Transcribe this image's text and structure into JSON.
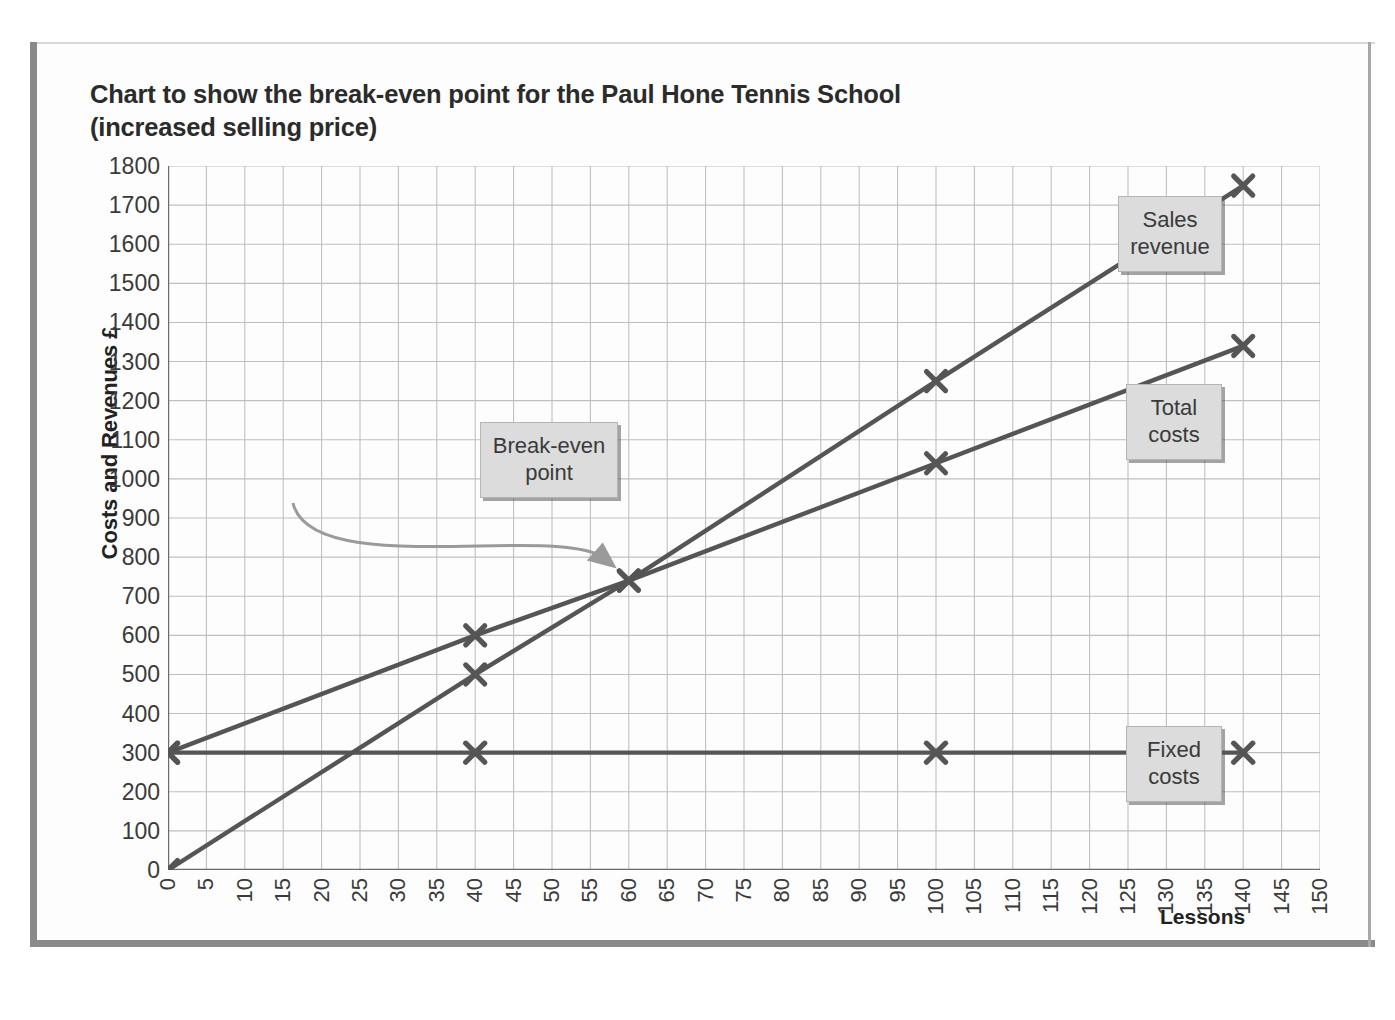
{
  "chart_data": {
    "type": "line",
    "title": "Chart to show the break-even point for the Paul Hone Tennis School (increased selling price)",
    "title_line1": "Chart to show the break-even point for the Paul Hone Tennis School",
    "title_line2": "(increased selling price)",
    "xlabel": "Lessons",
    "ylabel": "Costs and Revenues £",
    "xlim": [
      0,
      150
    ],
    "ylim": [
      0,
      1800
    ],
    "x_tick_step": 5,
    "y_tick_step": 100,
    "grid": true,
    "legend_position": "inline-callouts",
    "x_ticks": [
      0,
      5,
      10,
      15,
      20,
      25,
      30,
      35,
      40,
      45,
      50,
      55,
      60,
      65,
      70,
      75,
      80,
      85,
      90,
      95,
      100,
      105,
      110,
      115,
      120,
      125,
      130,
      135,
      140,
      145,
      150
    ],
    "y_ticks": [
      0,
      100,
      200,
      300,
      400,
      500,
      600,
      700,
      800,
      900,
      1000,
      1100,
      1200,
      1300,
      1400,
      1500,
      1600,
      1700,
      1800
    ],
    "series": [
      {
        "name": "Sales revenue",
        "color": "#555555",
        "marker": "x-bold",
        "x": [
          0,
          40,
          60,
          100,
          140
        ],
        "values": [
          0,
          500,
          740,
          1250,
          1750
        ]
      },
      {
        "name": "Total costs",
        "color": "#555555",
        "marker": "x-bold",
        "x": [
          0,
          40,
          60,
          100,
          140
        ],
        "values": [
          300,
          600,
          740,
          1040,
          1340
        ]
      },
      {
        "name": "Fixed costs",
        "color": "#555555",
        "marker": "x-bold",
        "x": [
          0,
          40,
          100,
          140
        ],
        "values": [
          300,
          300,
          300,
          300
        ]
      }
    ],
    "annotations": [
      {
        "id": "break-even",
        "text": "Break-even point",
        "text_line1": "Break-even",
        "text_line2": "point",
        "x": 60,
        "y": 740
      }
    ]
  },
  "callouts": {
    "sales": {
      "line1": "Sales",
      "line2": "revenue"
    },
    "total": {
      "line1": "Total",
      "line2": "costs"
    },
    "fixed": {
      "line1": "Fixed",
      "line2": "costs"
    },
    "breakeven": {
      "line1": "Break-even",
      "line2": "point"
    }
  },
  "colors": {
    "series_line": "#555555",
    "grid": "#bfbfbf",
    "axis": "#6b6b6b",
    "frame": "#8a8a8a",
    "callout_fill": "#dcdcdc",
    "text": "#2b2b2b"
  }
}
